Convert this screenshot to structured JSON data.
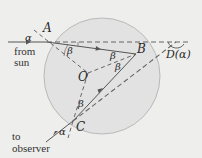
{
  "diagram": {
    "colors": {
      "background": "#eeeeec",
      "drop_fill": "#e2e2e2",
      "drop_stroke": "#b9b9b9",
      "ray": "#555555",
      "dashed": "#666666",
      "text": "#2a2a2a"
    },
    "points": {
      "A": "A",
      "B": "B",
      "C": "C",
      "O": "O"
    },
    "angle_labels": {
      "alpha_incident": "α",
      "beta_at_A": "β",
      "beta_at_B_1": "β",
      "beta_at_B_2": "β",
      "beta_at_C": "β",
      "alpha_exit": "α",
      "deviation": "D(α)"
    },
    "captions": {
      "from_sun_1": "from",
      "from_sun_2": "sun",
      "to_observer_1": "to",
      "to_observer_2": "observer"
    }
  }
}
